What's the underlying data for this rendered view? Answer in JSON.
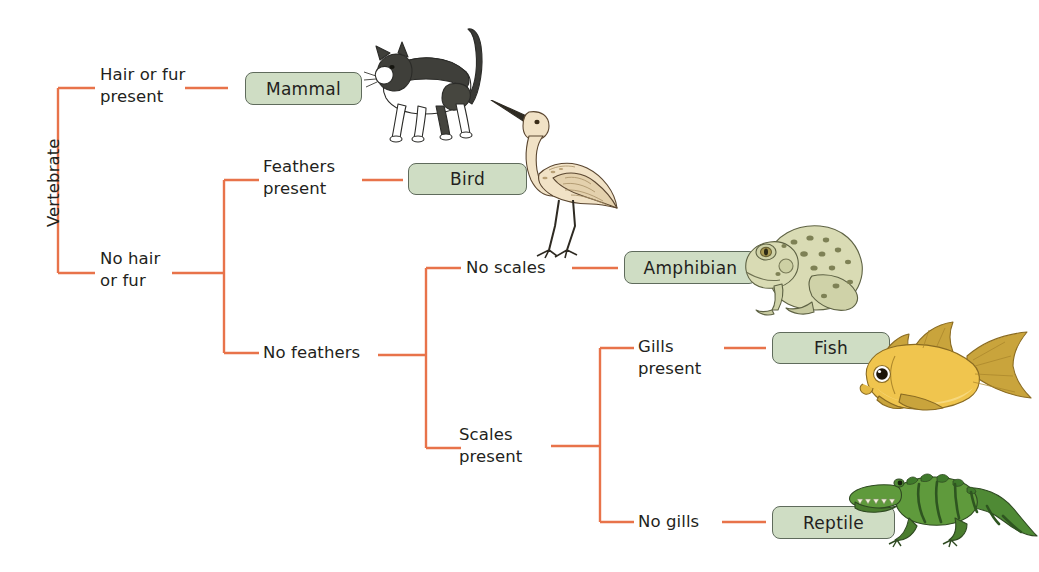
{
  "diagram": {
    "type": "dichotomous-key-tree",
    "root": {
      "label": "Vertebrate"
    },
    "colors": {
      "connector": "#e8734a",
      "box_fill": "#cfddc4",
      "box_border": "#5f6b5c",
      "text": "#231f20",
      "background": "#ffffff"
    },
    "criteria": [
      {
        "id": "hair-or-fur-present",
        "label": "Hair or fur\npresent"
      },
      {
        "id": "no-hair-or-fur",
        "label": "No hair\nor fur"
      },
      {
        "id": "feathers-present",
        "label": "Feathers\npresent"
      },
      {
        "id": "no-feathers",
        "label": "No feathers"
      },
      {
        "id": "no-scales",
        "label": "No scales"
      },
      {
        "id": "scales-present",
        "label": "Scales\npresent"
      },
      {
        "id": "gills-present",
        "label": "Gills\npresent"
      },
      {
        "id": "no-gills",
        "label": "No gills"
      }
    ],
    "taxa": [
      {
        "id": "mammal",
        "label": "Mammal",
        "animal": "cat"
      },
      {
        "id": "bird",
        "label": "Bird",
        "animal": "crane"
      },
      {
        "id": "amphibian",
        "label": "Amphibian",
        "animal": "frog"
      },
      {
        "id": "fish",
        "label": "Fish",
        "animal": "goldfish"
      },
      {
        "id": "reptile",
        "label": "Reptile",
        "animal": "crocodile"
      }
    ]
  }
}
